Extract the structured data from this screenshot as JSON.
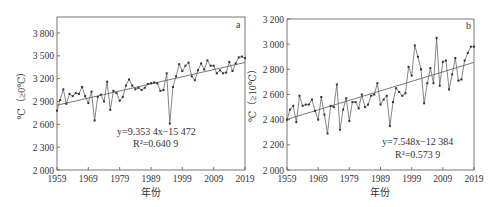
{
  "chart_data": [
    {
      "type": "line",
      "panel_label": "a",
      "title": "",
      "xlabel": "年份",
      "ylabel": "℃（≥0℃）",
      "ylim": [
        2000,
        4000
      ],
      "xlim": [
        1959,
        2019
      ],
      "yticks": [
        "2 000",
        "2 300",
        "2 600",
        "2 900",
        "3 200",
        "3 500",
        "3 800"
      ],
      "ytick_values": [
        2000,
        2300,
        2600,
        2900,
        3200,
        3500,
        3800
      ],
      "xticks": [
        "1959",
        "1969",
        "1979",
        "1989",
        "1999",
        "2009",
        "2019"
      ],
      "grid": false,
      "equation": "y=9.353 4x−15 472",
      "r2": "R²=0.640 9",
      "trend": {
        "slope": 9.3534,
        "intercept": -15472
      },
      "x": [
        1959,
        1960,
        1961,
        1962,
        1963,
        1964,
        1965,
        1966,
        1967,
        1968,
        1969,
        1970,
        1971,
        1972,
        1973,
        1974,
        1975,
        1976,
        1977,
        1978,
        1979,
        1980,
        1981,
        1982,
        1983,
        1984,
        1985,
        1986,
        1987,
        1988,
        1989,
        1990,
        1991,
        1992,
        1993,
        1994,
        1995,
        1996,
        1997,
        1998,
        1999,
        2000,
        2001,
        2002,
        2003,
        2004,
        2005,
        2006,
        2007,
        2008,
        2009,
        2010,
        2011,
        2012,
        2013,
        2014,
        2015,
        2016,
        2017,
        2018,
        2019
      ],
      "values": [
        2780,
        2920,
        3060,
        2870,
        3000,
        2970,
        3010,
        3000,
        3090,
        2970,
        2880,
        3030,
        2650,
        2960,
        2990,
        2900,
        3160,
        2790,
        3040,
        3010,
        2910,
        2960,
        3110,
        3190,
        3110,
        3060,
        3080,
        3050,
        3080,
        3130,
        3140,
        3150,
        3140,
        3040,
        3050,
        3270,
        2610,
        3090,
        3230,
        3390,
        3300,
        3370,
        3410,
        3230,
        3180,
        3310,
        3400,
        3320,
        3440,
        3370,
        3370,
        3270,
        3310,
        3270,
        3280,
        3420,
        3300,
        3400,
        3480,
        3490,
        3470
      ]
    },
    {
      "type": "line",
      "panel_label": "b",
      "title": "",
      "xlabel": "年份",
      "ylabel": "℃（≥10℃）",
      "ylim": [
        2000,
        3200
      ],
      "xlim": [
        1959,
        2019
      ],
      "yticks": [
        "2 000",
        "2 200",
        "2 400",
        "2 600",
        "2 800",
        "3 000",
        "3 200"
      ],
      "ytick_values": [
        2000,
        2200,
        2400,
        2600,
        2800,
        3000,
        3200
      ],
      "xticks": [
        "1959",
        "1969",
        "1979",
        "1989",
        "1999",
        "2009",
        "2019"
      ],
      "grid": false,
      "equation": "y=7.548x−12 384",
      "r2": "R²=0.573 9",
      "trend": {
        "slope": 7.548,
        "intercept": -12384
      },
      "x": [
        1959,
        1960,
        1961,
        1962,
        1963,
        1964,
        1965,
        1966,
        1967,
        1968,
        1969,
        1970,
        1971,
        1972,
        1973,
        1974,
        1975,
        1976,
        1977,
        1978,
        1979,
        1980,
        1981,
        1982,
        1983,
        1984,
        1985,
        1986,
        1987,
        1988,
        1989,
        1990,
        1991,
        1992,
        1993,
        1994,
        1995,
        1996,
        1997,
        1998,
        1999,
        2000,
        2001,
        2002,
        2003,
        2004,
        2005,
        2006,
        2007,
        2008,
        2009,
        2010,
        2011,
        2012,
        2013,
        2014,
        2015,
        2016,
        2017,
        2018,
        2019
      ],
      "values": [
        2400,
        2480,
        2510,
        2380,
        2590,
        2510,
        2520,
        2520,
        2560,
        2470,
        2400,
        2580,
        2440,
        2290,
        2510,
        2500,
        2680,
        2320,
        2480,
        2570,
        2390,
        2540,
        2540,
        2490,
        2600,
        2500,
        2520,
        2590,
        2600,
        2690,
        2520,
        2560,
        2590,
        2350,
        2540,
        2650,
        2620,
        2590,
        2610,
        2820,
        2750,
        2990,
        2900,
        2800,
        2530,
        2690,
        2810,
        2690,
        3050,
        2670,
        2860,
        2870,
        2640,
        2760,
        2890,
        2710,
        2720,
        2870,
        2930,
        2980,
        2980
      ]
    }
  ]
}
